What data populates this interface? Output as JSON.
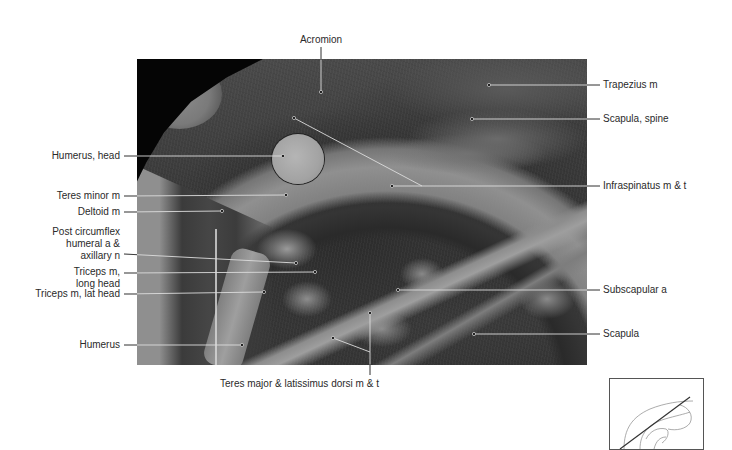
{
  "figure": {
    "photo_alt": "Transverse cross-section through the shoulder at the level of the humeral head",
    "labels": {
      "acromion": "Acromion",
      "trapezius": "Trapezius m",
      "scapula_spine": "Scapula, spine",
      "humerus_head": "Humerus, head",
      "infraspinatus": "Infraspinatus m & t",
      "teres_minor": "Teres minor m",
      "deltoid": "Deltoid m",
      "post_circumflex_1": "Post circumflex",
      "post_circumflex_2": "humeral a &",
      "post_circumflex_3": "axillary n",
      "triceps_long_1": "Triceps m,",
      "triceps_long_2": "long head",
      "triceps_lat": "Triceps m, lat head",
      "subscapular": "Subscapular a",
      "humerus": "Humerus",
      "scapula": "Scapula",
      "teres_major": "Teres major & latissimus dorsi m & t"
    },
    "inset": {
      "name": "orientation-diagram",
      "description": "Line drawing of shoulder with diagonal section plane"
    }
  }
}
